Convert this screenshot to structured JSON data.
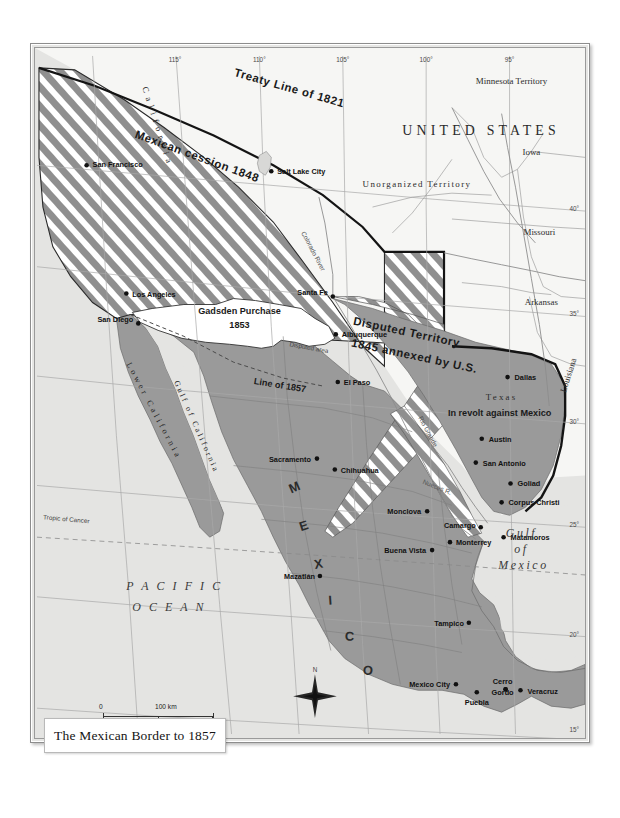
{
  "title": {
    "text": "The Mexican Border to 1857"
  },
  "scale": {
    "km_zero": "0",
    "km_max": "100 km",
    "mi_zero": "0",
    "mi_max": "100 miles"
  },
  "compass": {
    "north_label": "N"
  },
  "graticule": {
    "longitudes": [
      "115°",
      "110°",
      "105°",
      "100°",
      "95°"
    ],
    "latitudes": [
      "40°",
      "35°",
      "30°",
      "25°",
      "20°",
      "15°"
    ]
  },
  "territories": [
    {
      "name": "UNITED STATES"
    },
    {
      "name": "Minnesota Territory"
    },
    {
      "name": "Iowa"
    },
    {
      "name": "Unorganized Territory"
    },
    {
      "name": "Missouri"
    },
    {
      "name": "Arkansas"
    },
    {
      "name": "Louisiana"
    },
    {
      "name": "Texas"
    },
    {
      "name": "California"
    },
    {
      "name": "Lower California"
    }
  ],
  "annotations": {
    "treaty_line": "Treaty Line of 1821",
    "mexican_cession": "Mexican cession 1848",
    "gadsden_1": "Gadsden Purchase",
    "gadsden_2": "1853",
    "disputed_1": "Disputed Territory",
    "disputed_2": "1845 annexed by U.S.",
    "texas_revolt": "In revolt against Mexico",
    "line_1857": "Line of 1857",
    "disputed_strip": "Disputed area",
    "tropic": "Tropic of Cancer"
  },
  "mexico_letters": [
    "M",
    "E",
    "X",
    "I",
    "C",
    "O"
  ],
  "waters": {
    "pacific_1": "P A C I F I C",
    "pacific_2": "O C E A N",
    "gulf_mexico_1": "Gulf",
    "gulf_mexico_2": "of",
    "gulf_mexico_3": "Mexico",
    "gulf_california": "Gulf of California",
    "rio_grande": "Rio Grande",
    "nueces": "Nueces R.",
    "colorado": "Colorado River"
  },
  "cities": [
    {
      "name": "San Francisco",
      "x": 52,
      "y": 118,
      "anchor": "start",
      "dx": 6,
      "dy": 2
    },
    {
      "name": "Salt Lake City",
      "x": 238,
      "y": 124,
      "anchor": "start",
      "dx": 6,
      "dy": 3
    },
    {
      "name": "Los Angeles",
      "x": 92,
      "y": 247,
      "anchor": "start",
      "dx": 6,
      "dy": 3
    },
    {
      "name": "San Diego",
      "x": 104,
      "y": 277,
      "anchor": "end",
      "dx": -5,
      "dy": -1
    },
    {
      "name": "Santa Fe",
      "x": 300,
      "y": 250,
      "anchor": "end",
      "dx": -5,
      "dy": -2
    },
    {
      "name": "Albuquerque",
      "x": 303,
      "y": 288,
      "anchor": "start",
      "dx": 6,
      "dy": 3
    },
    {
      "name": "El Paso",
      "x": 305,
      "y": 336,
      "anchor": "start",
      "dx": 6,
      "dy": 3
    },
    {
      "name": "Dallas",
      "x": 476,
      "y": 331,
      "anchor": "start",
      "dx": 7,
      "dy": 3
    },
    {
      "name": "Austin",
      "x": 450,
      "y": 393,
      "anchor": "start",
      "dx": 7,
      "dy": 3
    },
    {
      "name": "San Antonio",
      "x": 444,
      "y": 417,
      "anchor": "start",
      "dx": 7,
      "dy": 3
    },
    {
      "name": "Goliad",
      "x": 479,
      "y": 438,
      "anchor": "start",
      "dx": 7,
      "dy": 3
    },
    {
      "name": "Corpus Christi",
      "x": 470,
      "y": 457,
      "anchor": "start",
      "dx": 7,
      "dy": 3
    },
    {
      "name": "Sacramento",
      "x": 284,
      "y": 413,
      "anchor": "end",
      "dx": -6,
      "dy": 3
    },
    {
      "name": "Chihuahua",
      "x": 302,
      "y": 424,
      "anchor": "start",
      "dx": 6,
      "dy": 3
    },
    {
      "name": "Monclova",
      "x": 395,
      "y": 466,
      "anchor": "end",
      "dx": -6,
      "dy": 3
    },
    {
      "name": "Camargo",
      "x": 449,
      "y": 482,
      "anchor": "end",
      "dx": -5,
      "dy": 1
    },
    {
      "name": "Monterrey",
      "x": 418,
      "y": 497,
      "anchor": "start",
      "dx": 6,
      "dy": 3
    },
    {
      "name": "Matamoros",
      "x": 472,
      "y": 492,
      "anchor": "start",
      "dx": 7,
      "dy": 3
    },
    {
      "name": "Buena Vista",
      "x": 400,
      "y": 505,
      "anchor": "end",
      "dx": -6,
      "dy": 3
    },
    {
      "name": "Mazatlán",
      "x": 287,
      "y": 531,
      "anchor": "end",
      "dx": -5,
      "dy": 3
    },
    {
      "name": "Tampico",
      "x": 437,
      "y": 578,
      "anchor": "end",
      "dx": -5,
      "dy": 3
    },
    {
      "name": "Mexico City",
      "x": 424,
      "y": 640,
      "anchor": "end",
      "dx": -6,
      "dy": 3
    },
    {
      "name": "Puebla",
      "x": 445,
      "y": 648,
      "anchor": "middle",
      "dx": 0,
      "dy": 13
    },
    {
      "name": "Cerro",
      "x": 474,
      "y": 645,
      "anchor": "middle",
      "dx": -3,
      "dy": -5
    },
    {
      "name": "Gordo",
      "x": 474,
      "y": 645,
      "anchor": "middle",
      "dx": -3,
      "dy": 6
    },
    {
      "name": "Veracruz",
      "x": 489,
      "y": 646,
      "anchor": "start",
      "dx": 7,
      "dy": 4
    }
  ],
  "colors": {
    "ocean": "#e4e4e2",
    "us_land": "#f5f5f3",
    "mexico": "#9a9a9a",
    "cession_hatch": "#8d8d8d",
    "gadsden": "#ffffff",
    "border": "#1a1a1a",
    "graticule": "#a9a9a9"
  }
}
